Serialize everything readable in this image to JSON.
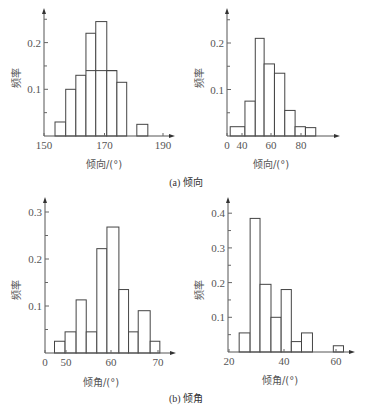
{
  "captions": {
    "a": "(a) 倾向",
    "b": "(b) 倾角"
  },
  "chart_data": [
    {
      "id": "a-left",
      "type": "bar",
      "title": "",
      "panel": "(a) 倾向",
      "xlabel": "倾向/(°)",
      "ylabel": "频率",
      "xticks": [
        "150",
        "170",
        "190"
      ],
      "yticks": [
        "0.1",
        "0.2"
      ],
      "xlim": [
        150,
        190
      ],
      "ylim": [
        0,
        0.27
      ],
      "grid": false,
      "bins": [
        {
          "from": 153.7,
          "to": 157.3,
          "value": 0.03
        },
        {
          "from": 157.3,
          "to": 160.7,
          "value": 0.1
        },
        {
          "from": 160.7,
          "to": 164.1,
          "value": 0.13
        },
        {
          "from": 164.1,
          "to": 167.4,
          "value": 0.22
        },
        {
          "from": 167.4,
          "to": 171.1,
          "value": 0.245
        },
        {
          "from": 171.1,
          "to": 174.5,
          "value": 0.14
        },
        {
          "from": 174.5,
          "to": 177.8,
          "value": 0.115
        },
        {
          "from": 181.2,
          "to": 184.9,
          "value": 0.025
        }
      ],
      "overlay_series": {
        "name": "inner step",
        "from": 164.1,
        "to": 174.5,
        "value": 0.14
      }
    },
    {
      "id": "a-right",
      "type": "bar",
      "title": "",
      "panel": "(a) 倾向",
      "xlabel": "倾向/(°)",
      "ylabel": "频率",
      "xticks": [
        "0",
        "40",
        "60",
        "80"
      ],
      "yticks": [
        "0.1",
        "0.2"
      ],
      "ylim": [
        0,
        0.27
      ],
      "grid": false,
      "bins": [
        {
          "from": 32,
          "to": 42,
          "value": 0.02
        },
        {
          "from": 42,
          "to": 49,
          "value": 0.075
        },
        {
          "from": 49,
          "to": 55,
          "value": 0.21
        },
        {
          "from": 55,
          "to": 62,
          "value": 0.155
        },
        {
          "from": 62,
          "to": 69,
          "value": 0.135
        },
        {
          "from": 69,
          "to": 76,
          "value": 0.055
        },
        {
          "from": 76,
          "to": 83,
          "value": 0.02
        },
        {
          "from": 83,
          "to": 90,
          "value": 0.018
        }
      ]
    },
    {
      "id": "b-left",
      "type": "bar",
      "title": "",
      "panel": "(b) 倾角",
      "xlabel": "倾角/(°)",
      "ylabel": "频率",
      "xticks": [
        "0",
        "50",
        "60",
        "70"
      ],
      "yticks": [
        "0.1",
        "0.2",
        "0.3"
      ],
      "ylim": [
        0,
        0.31
      ],
      "grid": false,
      "bins": [
        {
          "from": 47.5,
          "to": 49.8,
          "value": 0.025
        },
        {
          "from": 49.8,
          "to": 52.2,
          "value": 0.045
        },
        {
          "from": 52.2,
          "to": 54.4,
          "value": 0.113
        },
        {
          "from": 54.4,
          "to": 56.7,
          "value": 0.045
        },
        {
          "from": 56.7,
          "to": 58.9,
          "value": 0.222
        },
        {
          "from": 58.9,
          "to": 61.5,
          "value": 0.268
        },
        {
          "from": 61.5,
          "to": 63.6,
          "value": 0.135
        },
        {
          "from": 63.6,
          "to": 65.7,
          "value": 0.045
        },
        {
          "from": 65.7,
          "to": 68.3,
          "value": 0.09
        },
        {
          "from": 68.3,
          "to": 70.4,
          "value": 0.025
        }
      ]
    },
    {
      "id": "b-right",
      "type": "bar",
      "title": "",
      "panel": "(b) 倾角",
      "xlabel": "倾角/(°)",
      "ylabel": "频率",
      "xticks": [
        "20",
        "40",
        "60"
      ],
      "yticks": [
        "0.1",
        "0.2",
        "0.3",
        "0.4"
      ],
      "xlim": [
        20,
        65
      ],
      "ylim": [
        0,
        0.41
      ],
      "grid": false,
      "bins": [
        {
          "from": 23.8,
          "to": 27.9,
          "value": 0.055
        },
        {
          "from": 27.9,
          "to": 31.6,
          "value": 0.385
        },
        {
          "from": 31.6,
          "to": 35.7,
          "value": 0.195
        },
        {
          "from": 35.7,
          "to": 39.5,
          "value": 0.1
        },
        {
          "from": 39.5,
          "to": 43.3,
          "value": 0.18
        },
        {
          "from": 43.3,
          "to": 47.1,
          "value": 0.03
        },
        {
          "from": 47.1,
          "to": 51.2,
          "value": 0.055
        },
        {
          "from": 59.0,
          "to": 62.8,
          "value": 0.018
        }
      ]
    }
  ]
}
